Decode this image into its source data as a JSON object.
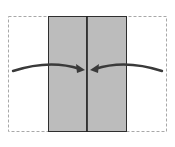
{
  "diagram": {
    "colors": {
      "background": "#ffffff",
      "panel_fill": "#bcbcbc",
      "panel_stroke": "#2e2e2e",
      "dashed_outline": "#a8a8a8",
      "arrow": "#3a3a3a"
    },
    "outline": {
      "x": 8,
      "y": 16,
      "width": 159,
      "height": 116,
      "style": "dashed"
    },
    "panels": [
      {
        "id": "left-panel",
        "x": 48,
        "y": 16,
        "width": 39,
        "height": 116
      },
      {
        "id": "right-panel",
        "x": 87,
        "y": 16,
        "width": 40,
        "height": 116
      }
    ],
    "center_line_x": 87,
    "arrows": [
      {
        "id": "left-fold-arrow",
        "direction": "right",
        "from": [
          13,
          71
        ],
        "to": [
          84,
          70
        ]
      },
      {
        "id": "right-fold-arrow",
        "direction": "left",
        "from": [
          162,
          71
        ],
        "to": [
          91,
          70
        ]
      }
    ]
  }
}
